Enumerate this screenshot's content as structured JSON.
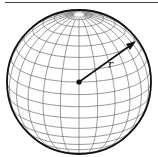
{
  "diagram": {
    "radius_label": "r",
    "colors": {
      "outline": "#111111",
      "grid": "#6a6a6a",
      "arrow": "#111111",
      "rule": "#444444"
    }
  }
}
